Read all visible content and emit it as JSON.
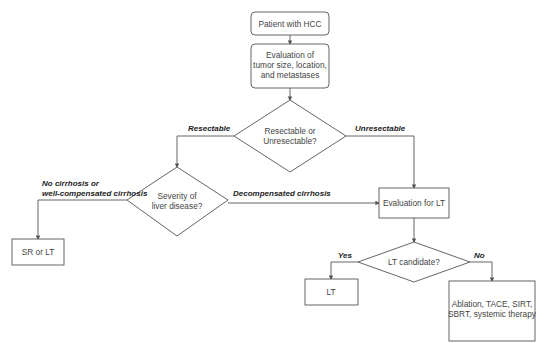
{
  "diagram": {
    "type": "flowchart",
    "nodes": {
      "start": {
        "lines": [
          "Patient with HCC"
        ]
      },
      "evaluation": {
        "lines": [
          "Evaluation of",
          "tumor size, location,",
          "and metastases"
        ]
      },
      "resectable_decision": {
        "lines": [
          "Resectable or",
          "Unresectable?"
        ]
      },
      "severity_decision": {
        "lines": [
          "Severity of",
          "liver disease?"
        ]
      },
      "sr_or_lt": {
        "lines": [
          "SR or LT"
        ]
      },
      "eval_lt": {
        "lines": [
          "Evaluation for LT"
        ]
      },
      "lt_candidate": {
        "lines": [
          "LT candidate?"
        ]
      },
      "lt": {
        "lines": [
          "LT"
        ]
      },
      "therapy": {
        "lines": [
          "Ablation, TACE, SIRT,",
          "SBRT, systemic therapy"
        ]
      }
    },
    "edges": {
      "resectable": "Resectable",
      "unresectable": "Unresectable",
      "no_cirrhosis_1": "No cirrhosis or",
      "no_cirrhosis_2": "well-compensated cirrhosis",
      "decompensated": "Decompensated cirrhosis",
      "yes": "Yes",
      "no": "No"
    },
    "colors": {
      "stroke": "#555555",
      "text": "#444444",
      "label": "#222222",
      "background": "#ffffff"
    }
  }
}
